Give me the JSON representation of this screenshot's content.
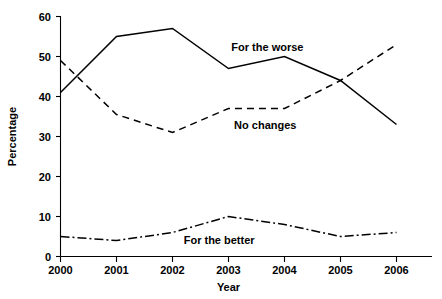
{
  "chart_data": {
    "type": "line",
    "title": "",
    "xlabel": "Year",
    "ylabel": "Percentage",
    "x": [
      "2000",
      "2001",
      "2002",
      "2003",
      "2004",
      "2005",
      "2006"
    ],
    "categories": [
      "2000",
      "2001",
      "2002",
      "2003",
      "2004",
      "2005",
      "2006"
    ],
    "xlim": [
      2000,
      2006
    ],
    "ylim": [
      0,
      60
    ],
    "yticks": [
      0,
      10,
      20,
      30,
      40,
      50,
      60
    ],
    "xticks": [
      "2000",
      "2001",
      "2002",
      "2003",
      "2004",
      "2005",
      "2006"
    ],
    "grid": false,
    "legend_position": "inline-annotations",
    "series": [
      {
        "name": "For the worse",
        "style": "solid",
        "color": "#000000",
        "values": [
          41,
          55,
          57,
          47,
          50,
          44,
          33
        ]
      },
      {
        "name": "No changes",
        "style": "dashed",
        "color": "#000000",
        "values": [
          49,
          35.5,
          31,
          37,
          37,
          44,
          53
        ]
      },
      {
        "name": "For the better",
        "style": "dash-dot",
        "color": "#000000",
        "values": [
          5,
          4,
          6,
          10,
          8,
          5,
          6
        ]
      }
    ],
    "annotations": [
      {
        "text": "For the worse",
        "x": 2003.05,
        "y": 52.5
      },
      {
        "text": "No changes",
        "x": 2003.1,
        "y": 32.8
      },
      {
        "text": "For the better",
        "x": 2002.2,
        "y": 4.2
      }
    ]
  },
  "axes": {
    "y_tick_labels": [
      "0",
      "10",
      "20",
      "30",
      "40",
      "50",
      "60"
    ],
    "x_tick_labels": [
      "2000",
      "2001",
      "2002",
      "2003",
      "2004",
      "2005",
      "2006"
    ],
    "y_axis_title": "Percentage",
    "x_axis_title": "Year"
  }
}
